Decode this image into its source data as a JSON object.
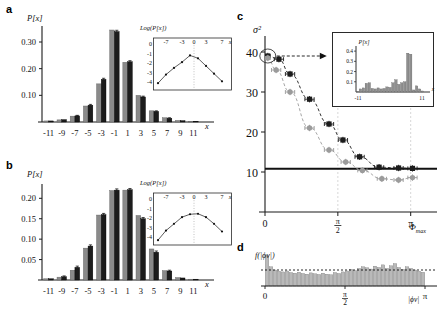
{
  "figure": {
    "panels": [
      "a",
      "b",
      "c",
      "d"
    ]
  },
  "panel_a": {
    "label": "a",
    "ylabel": "P[x]",
    "xlabel": "x",
    "yticks": [
      "0.10",
      "0.20",
      "0.30"
    ],
    "xticks": [
      "-11",
      "-9",
      "-7",
      "-5",
      "-3",
      "-1",
      "1",
      "3",
      "5",
      "7",
      "9",
      "11"
    ],
    "inset": {
      "title": "Log(P[x])",
      "xlabel": "x",
      "xticks": [
        "-7",
        "-3",
        "0",
        "3",
        "7"
      ],
      "yticks": [
        "0",
        "-1",
        "-2",
        "-3",
        "-4"
      ]
    }
  },
  "panel_b": {
    "label": "b",
    "ylabel": "P[x]",
    "xlabel": "x",
    "yticks": [
      "0.05",
      "0.10",
      "0.15",
      "0.20"
    ],
    "xticks": [
      "-11",
      "-9",
      "-7",
      "-5",
      "-3",
      "-1",
      "1",
      "3",
      "5",
      "7",
      "9",
      "11"
    ],
    "inset": {
      "title": "Log(P[x])",
      "xlabel": "x",
      "xticks": [
        "-7",
        "-3",
        "0",
        "3",
        "7"
      ],
      "yticks": [
        "0",
        "-1",
        "-2",
        "-3",
        "-4"
      ]
    }
  },
  "panel_c": {
    "label": "c",
    "ylabel": "σ²",
    "xlabel": "Φ",
    "xlabel_sub": "max",
    "yticks": [
      "10",
      "20",
      "30",
      "40"
    ],
    "xticks": [
      "0",
      "π/2",
      "π"
    ],
    "inset": {
      "title": "P[x]",
      "xlabel": "x",
      "xticks": [
        "-11",
        "11"
      ],
      "yticks": [
        "0.1",
        "0.2",
        "0.3",
        "0.4"
      ]
    }
  },
  "panel_d": {
    "label": "d",
    "ylabel": "f(|ϕv|)",
    "xlabel": "|ϕv|",
    "xticks": [
      "0",
      "π/2",
      "π"
    ]
  },
  "colors": {
    "gray_bar": "#8a8a8a",
    "black_bar": "#1c1c1c",
    "gray_series": "#9b9b9b",
    "black_series": "#1c1c1c",
    "axis": "#1a1a1a",
    "guide": "#cfcfcf"
  },
  "chart_data": [
    {
      "type": "bar",
      "panel": "a",
      "title": "",
      "xlabel": "x",
      "ylabel": "P[x]",
      "categories": [
        -11,
        -9,
        -7,
        -5,
        -3,
        -1,
        1,
        3,
        5,
        7,
        9,
        11
      ],
      "ylim": [
        0,
        0.36
      ],
      "xlim": [
        -12,
        12
      ],
      "grid": false,
      "legend": "none",
      "series": [
        {
          "name": "gray",
          "values": [
            0.004,
            0.008,
            0.022,
            0.06,
            0.143,
            0.345,
            0.224,
            0.1,
            0.042,
            0.016,
            0.006,
            0.003
          ]
        },
        {
          "name": "black",
          "values": [
            0.004,
            0.009,
            0.023,
            0.063,
            0.16,
            0.339,
            0.226,
            0.094,
            0.04,
            0.014,
            0.005,
            0.003
          ]
        }
      ],
      "errors": [
        0.002,
        0.002,
        0.002,
        0.003,
        0.004,
        0.005,
        0.004,
        0.003,
        0.002,
        0.002,
        0.001,
        0.001
      ]
    },
    {
      "type": "line",
      "panel": "a_inset",
      "title": "Log(P[x])",
      "xlabel": "x",
      "ylabel": "",
      "x": [
        -9,
        -7,
        -5,
        -3,
        -1,
        1,
        3,
        5,
        7
      ],
      "y": [
        -4.1,
        -3.2,
        -2.5,
        -1.9,
        -1.2,
        -1.5,
        -2.3,
        -3.1,
        -3.9
      ],
      "xlim": [
        -10,
        8
      ],
      "ylim": [
        -4.6,
        0.2
      ],
      "xticks": [
        -7,
        -3,
        0,
        3,
        7
      ],
      "yticks": [
        0,
        -1,
        -2,
        -3,
        -4
      ],
      "grid": false,
      "annotation": "tent-shaped exponential peak at x=0"
    },
    {
      "type": "bar",
      "panel": "b",
      "title": "",
      "xlabel": "x",
      "ylabel": "P[x]",
      "categories": [
        -11,
        -9,
        -7,
        -5,
        -3,
        -1,
        1,
        3,
        5,
        7,
        9,
        11
      ],
      "ylim": [
        0,
        0.235
      ],
      "xlim": [
        -12,
        12
      ],
      "grid": false,
      "legend": "none",
      "series": [
        {
          "name": "gray",
          "values": [
            0.003,
            0.007,
            0.024,
            0.078,
            0.159,
            0.219,
            0.22,
            0.158,
            0.076,
            0.023,
            0.006,
            0.002
          ]
        },
        {
          "name": "black",
          "values": [
            0.003,
            0.008,
            0.031,
            0.083,
            0.16,
            0.22,
            0.221,
            0.15,
            0.068,
            0.022,
            0.005,
            0.002
          ]
        }
      ],
      "errors": [
        0.002,
        0.002,
        0.003,
        0.003,
        0.003,
        0.003,
        0.003,
        0.003,
        0.003,
        0.002,
        0.001,
        0.001
      ]
    },
    {
      "type": "line",
      "panel": "b_inset",
      "title": "Log(P[x])",
      "xlabel": "x",
      "ylabel": "",
      "x": [
        -9,
        -7,
        -5,
        -3,
        -1,
        1,
        3,
        5,
        7
      ],
      "y": [
        -4.3,
        -3.3,
        -2.6,
        -1.9,
        -1.6,
        -1.55,
        -1.9,
        -2.6,
        -3.4
      ],
      "xlim": [
        -10,
        8
      ],
      "ylim": [
        -4.6,
        0.2
      ],
      "xticks": [
        -7,
        -3,
        0,
        3,
        7
      ],
      "yticks": [
        0,
        -1,
        -2,
        -3,
        -4
      ],
      "grid": false,
      "annotation": "parabolic Gaussian log-profile"
    },
    {
      "type": "scatter",
      "panel": "c",
      "title": "",
      "xlabel": "Φmax",
      "ylabel": "σ²",
      "xlim": [
        0,
        3.45
      ],
      "ylim": [
        0,
        44
      ],
      "xticks": [
        0,
        1.5708,
        3.1416
      ],
      "xticklabels": [
        "0",
        "π/2",
        "π"
      ],
      "yticks": [
        10,
        20,
        30,
        40
      ],
      "grid": false,
      "reference_line_y": 10.8,
      "series": [
        {
          "name": "black-squares",
          "x": [
            0.06,
            0.3,
            0.54,
            0.96,
            1.38,
            1.68,
            2.04,
            2.46,
            2.88,
            3.18
          ],
          "y": [
            39.0,
            38.2,
            34.5,
            28.2,
            22.0,
            18.0,
            13.8,
            11.2,
            11.0,
            10.9
          ],
          "xerr": [
            0.05,
            0.1,
            0.1,
            0.1,
            0.1,
            0.1,
            0.1,
            0.1,
            0.1,
            0.1
          ],
          "yerr": [
            0.8,
            0.8,
            0.8,
            0.8,
            0.8,
            0.8,
            0.8,
            0.8,
            0.8,
            0.8
          ]
        },
        {
          "name": "gray-circles",
          "x": [
            0.06,
            0.24,
            0.54,
            0.96,
            1.38,
            1.74,
            2.1,
            2.52,
            2.88,
            3.18
          ],
          "y": [
            38.5,
            35.5,
            30.0,
            21.0,
            15.5,
            12.5,
            10.4,
            8.3,
            8.0,
            8.6
          ],
          "xerr": [
            0.05,
            0.1,
            0.1,
            0.1,
            0.1,
            0.1,
            0.1,
            0.1,
            0.1,
            0.1
          ],
          "yerr": [
            0.8,
            0.8,
            0.8,
            0.8,
            0.8,
            0.8,
            0.8,
            0.8,
            0.8,
            0.8
          ]
        }
      ],
      "annotations": [
        "circled first point at (0, 39) with arrow to inset"
      ]
    },
    {
      "type": "bar",
      "panel": "c_inset",
      "title": "P[x]",
      "xlabel": "x",
      "ylabel": "",
      "xlim": [
        -12,
        12
      ],
      "ylim": [
        0,
        0.45
      ],
      "yticks": [
        0.1,
        0.2,
        0.3,
        0.4
      ],
      "xticklabels": [
        "-11",
        "11"
      ],
      "categories": [
        -11,
        -10,
        -9,
        -8,
        -7,
        -6,
        -5,
        -4,
        -3,
        -2,
        -1,
        0,
        1,
        2,
        3,
        4,
        5,
        6,
        7,
        8,
        9,
        10,
        11
      ],
      "values": [
        0.005,
        0.03,
        0.04,
        0.085,
        0.09,
        0.035,
        0.03,
        0.04,
        0.03,
        0.035,
        0.05,
        0.045,
        0.09,
        0.12,
        0.075,
        0.09,
        0.1,
        0.38,
        0.37,
        0.02,
        0.06,
        0.03,
        0.01
      ],
      "grid": false,
      "annotation": "irregular distribution with a tall spike near x=6-7"
    },
    {
      "type": "bar",
      "panel": "d",
      "title": "",
      "xlabel": "|ϕv|",
      "ylabel": "f(|ϕv|)",
      "xlim": [
        0,
        3.1416
      ],
      "ylim": [
        0,
        1.0
      ],
      "xticks": [
        0,
        1.5708,
        3.1416
      ],
      "xticklabels": [
        "0",
        "π/2",
        "π"
      ],
      "grid": false,
      "reference_line_y": 0.5,
      "values": [
        0.95,
        0.6,
        0.5,
        0.46,
        0.44,
        0.47,
        0.42,
        0.4,
        0.43,
        0.39,
        0.37,
        0.41,
        0.38,
        0.36,
        0.4,
        0.37,
        0.35,
        0.42,
        0.39,
        0.44,
        0.47,
        0.52,
        0.48,
        0.55,
        0.6,
        0.57,
        0.53,
        0.62,
        0.58,
        0.66,
        0.55,
        0.63,
        0.7,
        0.58,
        0.52,
        0.6,
        0.55,
        0.5,
        0.46,
        0.43
      ],
      "annotation": "near-uniform density with dotted mean line"
    }
  ]
}
